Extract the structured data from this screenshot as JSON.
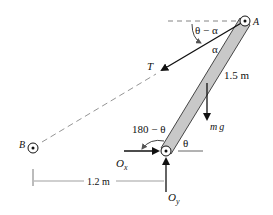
{
  "diagram": {
    "points": {
      "A": "A",
      "B": "B"
    },
    "labels": {
      "angle_top": "θ − α",
      "alpha": "α",
      "tension": "T",
      "length": "1.5 m",
      "weight_m": "m",
      "weight_g": "g",
      "angle_supp": "180 − θ",
      "theta": "θ",
      "ox_main": "O",
      "ox_sub": "x",
      "oy_main": "O",
      "oy_sub": "y",
      "distance": "1.2 m"
    },
    "colors": {
      "bar_fill": "#c8c8c8",
      "line": "#111111",
      "dashed": "#888888"
    }
  }
}
